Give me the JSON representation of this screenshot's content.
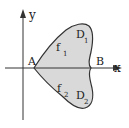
{
  "diagram": {
    "axes": {
      "x_label": "x",
      "y_label": "y"
    },
    "points": {
      "A": "A",
      "B": "B"
    },
    "regions": {
      "upper": {
        "name": "D",
        "subscript": "1"
      },
      "lower": {
        "name": "D",
        "subscript": "2"
      }
    },
    "curves": {
      "upper": {
        "name": "f",
        "subscript": "1"
      },
      "lower": {
        "name": "f",
        "subscript": "2"
      }
    },
    "colors": {
      "region_fill": "#d9d9d9",
      "stroke": "#333333",
      "background": "#ffffff"
    }
  }
}
